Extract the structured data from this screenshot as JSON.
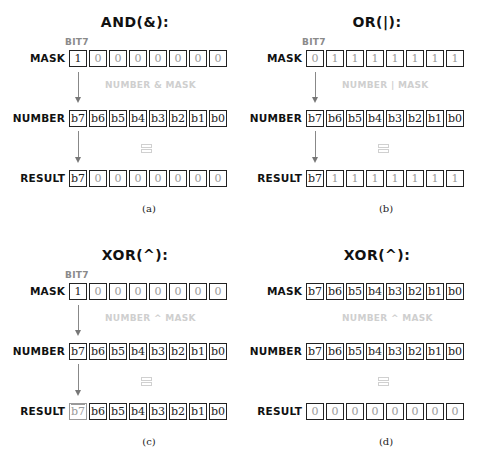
{
  "panels": [
    {
      "id": "a",
      "title": "AND(&):",
      "bit_label": "BIT7",
      "mask_label": "MASK",
      "mask": [
        "1",
        "0",
        "0",
        "0",
        "0",
        "0",
        "0",
        "0"
      ],
      "operation": "NUMBER & MASK",
      "number_label": "NUMBER",
      "number": [
        "b7",
        "b6",
        "b5",
        "b4",
        "b3",
        "b2",
        "b1",
        "b0"
      ],
      "equals": "=",
      "result_label": "RESULT",
      "result": [
        "b7",
        "0",
        "0",
        "0",
        "0",
        "0",
        "0",
        "0"
      ],
      "caption": "(a)"
    },
    {
      "id": "b",
      "title": "OR(|):",
      "bit_label": "BIT7",
      "mask_label": "MASK",
      "mask": [
        "0",
        "1",
        "1",
        "1",
        "1",
        "1",
        "1",
        "1"
      ],
      "operation": "NUMBER | MASK",
      "number_label": "NUMBER",
      "number": [
        "b7",
        "b6",
        "b5",
        "b4",
        "b3",
        "b2",
        "b1",
        "b0"
      ],
      "equals": "=",
      "result_label": "RESULT",
      "result": [
        "b7",
        "1",
        "1",
        "1",
        "1",
        "1",
        "1",
        "1"
      ],
      "caption": "(b)"
    },
    {
      "id": "c",
      "title": "XOR(^):",
      "bit_label": "BIT7",
      "mask_label": "MASK",
      "mask": [
        "1",
        "0",
        "0",
        "0",
        "0",
        "0",
        "0",
        "0"
      ],
      "operation": "NUMBER ^ MASK",
      "number_label": "NUMBER",
      "number": [
        "b7",
        "b6",
        "b5",
        "b4",
        "b3",
        "b2",
        "b1",
        "b0"
      ],
      "equals": "=",
      "result_label": "RESULT",
      "result": [
        "b7",
        "b6",
        "b5",
        "b4",
        "b3",
        "b2",
        "b1",
        "b0"
      ],
      "result_first_negated": true,
      "caption": "(c)"
    },
    {
      "id": "d",
      "title": "XOR(^):",
      "mask_label": "MASK",
      "mask": [
        "b7",
        "b6",
        "b5",
        "b4",
        "b3",
        "b2",
        "b1",
        "b0"
      ],
      "operation": "NUMBER ^ MASK",
      "number_label": "NUMBER",
      "number": [
        "b7",
        "b6",
        "b5",
        "b4",
        "b3",
        "b2",
        "b1",
        "b0"
      ],
      "equals": "=",
      "result_label": "RESULT",
      "result": [
        "0",
        "0",
        "0",
        "0",
        "0",
        "0",
        "0",
        "0"
      ],
      "caption": "(d)"
    }
  ],
  "colors": {
    "text": "#111111",
    "bit_label": "#8a8a8a",
    "operation_text": "#cfcfcf",
    "arrow": "#777777",
    "box_border": "#222222"
  }
}
